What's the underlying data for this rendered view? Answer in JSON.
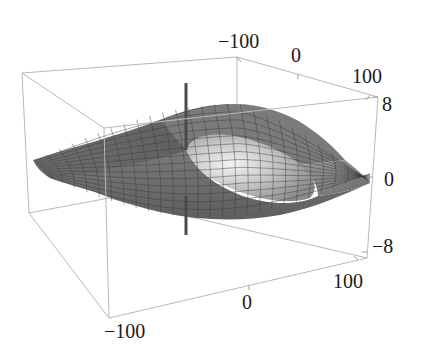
{
  "chart_data": {
    "type": "surface3d",
    "title": "",
    "x_axis": {
      "label": "",
      "range": [
        -100,
        100
      ],
      "ticks": [
        -100,
        0,
        100
      ],
      "tick_labels": [
        "-100",
        "0",
        "100"
      ]
    },
    "y_axis": {
      "label": "",
      "range": [
        -100,
        100
      ],
      "ticks": [
        -100,
        0,
        100
      ],
      "tick_labels": [
        "−100",
        "0",
        "100"
      ]
    },
    "z_axis": {
      "label": "",
      "range": [
        -8,
        8
      ],
      "ticks": [
        -8,
        0,
        8
      ],
      "tick_labels": [
        "−8",
        "0",
        "8"
      ]
    },
    "top_axis_tick_labels": [
      "−100",
      "0",
      "100"
    ],
    "bottom_axis_tick_labels": [
      "−100",
      "0",
      "100"
    ],
    "right_axis_tick_labels": [
      "8",
      "0",
      "−8"
    ],
    "surface": {
      "shading": "grayscale",
      "features": [
        "ridge along one diagonal",
        "hollow near origin",
        "vertical singular spike at origin"
      ],
      "spike_z_range": [
        -8,
        8
      ]
    },
    "grid": false,
    "box": true,
    "legend": "none"
  }
}
